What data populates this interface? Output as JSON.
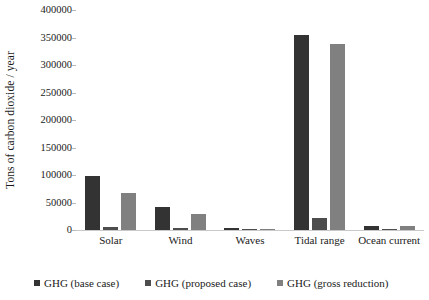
{
  "chart_data": {
    "type": "bar",
    "title": "",
    "xlabel": "",
    "ylabel": "Tons of carbon dioxide / year",
    "ylim": [
      0,
      400000
    ],
    "ytick_labels": [
      "400000",
      "350000",
      "300000",
      "250000",
      "200000",
      "150000",
      "100000",
      "50000",
      "0"
    ],
    "ytick_values": [
      400000,
      350000,
      300000,
      250000,
      200000,
      150000,
      100000,
      50000,
      0
    ],
    "grid": false,
    "legend_position": "bottom",
    "categories": [
      "Solar",
      "Wind",
      "Waves",
      "Tidal range",
      "Ocean current"
    ],
    "series": [
      {
        "name": "GHG (base case)",
        "color": "#333333",
        "values": [
          98000,
          41000,
          3000,
          354000,
          8000
        ]
      },
      {
        "name": "GHG (proposed case)",
        "color": "#4d4d4d",
        "values": [
          5000,
          3000,
          500,
          22000,
          800
        ]
      },
      {
        "name": "GHG (gross reduction)",
        "color": "#808080",
        "values": [
          68000,
          30000,
          2500,
          338000,
          7000
        ]
      }
    ]
  }
}
